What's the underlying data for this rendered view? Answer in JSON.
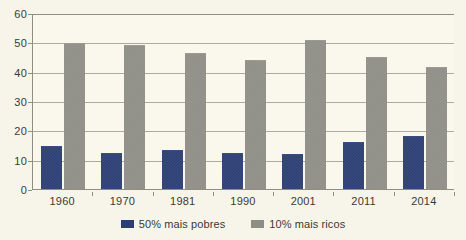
{
  "chart_data": {
    "type": "bar",
    "title": "",
    "subtitle": "",
    "xlabel": "",
    "ylabel": "",
    "categories": [
      "1960",
      "1970",
      "1981",
      "1990",
      "2001",
      "2011",
      "2014"
    ],
    "series": [
      {
        "name": "50% mais pobres",
        "color": "#2b3f73",
        "values": [
          14.3,
          12.0,
          13.0,
          12.1,
          11.7,
          15.6,
          17.7
        ]
      },
      {
        "name": "10% mais ricos",
        "color": "#8e8e86",
        "values": [
          49.4,
          48.6,
          46.0,
          43.5,
          50.3,
          44.7,
          41.2
        ]
      }
    ],
    "ylim": [
      0,
      60
    ],
    "yticks": [
      0,
      10,
      20,
      30,
      40,
      50,
      60
    ],
    "ytick_labels": [
      "0",
      "10",
      "20",
      "30",
      "40",
      "50",
      "60"
    ],
    "grid": true,
    "grid_axis": "y",
    "legend_position": "bottom"
  },
  "legend": {
    "entries": [
      {
        "label": "50% mais pobres"
      },
      {
        "label": "10% mais ricos"
      }
    ]
  },
  "colors": {
    "background": "#f7f5e9",
    "plot_background": "#faf8ec",
    "grid": "#a9ab9f",
    "axis": "#8d8f84",
    "text": "#3b3a33",
    "series_poor": "#2b3f73",
    "series_rich": "#8e8e86"
  }
}
